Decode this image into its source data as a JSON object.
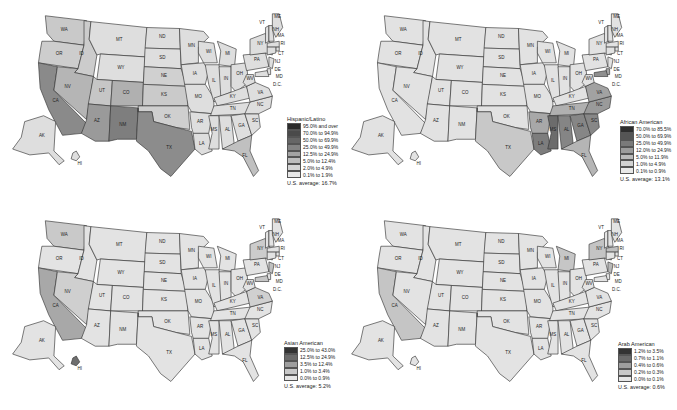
{
  "maps": [
    {
      "id": "hispanic",
      "legend": {
        "title": "Hispanic/Latino",
        "classes": [
          "95.0% and over",
          "70.0% to 94.9%",
          "50.0% to 69.9%",
          "25.0% to 49.9%",
          "12.5% to 24.9%",
          "5.0% to 12.4%",
          "2.0% to 4.9%",
          "0.1% to 1.9%"
        ],
        "colors": [
          "#2b2b2b",
          "#4a4a4a",
          "#666666",
          "#838383",
          "#a3a3a3",
          "#bdbdbd",
          "#d4d4d4",
          "#e8e8e8"
        ],
        "average": "U.S. average: 16.7%"
      }
    },
    {
      "id": "african-american",
      "legend": {
        "title": "African American",
        "classes": [
          "70.0% to 85.5%",
          "50.0% to 69.9%",
          "25.0% to 49.9%",
          "12.0% to 24.9%",
          "5.0% to 11.9%",
          "1.0% to 4.9%",
          "0.1% to 0.9%"
        ],
        "colors": [
          "#2e2e2e",
          "#555555",
          "#7a7a7a",
          "#9c9c9c",
          "#bababa",
          "#d2d2d2",
          "#e8e8e8"
        ],
        "average": "U.S. average: 13.1%"
      }
    },
    {
      "id": "asian-american",
      "legend": {
        "title": "Asian American",
        "classes": [
          "25.0% to 43.0%",
          "12.5% to 24.9%",
          "3.5% to 12.4%",
          "1.0% to 3.4%",
          "0.0% to 0.9%"
        ],
        "colors": [
          "#333333",
          "#6a6a6a",
          "#9e9e9e",
          "#c8c8c8",
          "#e6e6e6"
        ],
        "average": "U.S. average: 5.2%"
      }
    },
    {
      "id": "arab-american",
      "legend": {
        "title": "Arab American",
        "classes": [
          "1.2% to 3.5%",
          "0.7% to 1.1%",
          "0.4% to 0.6%",
          "0.2% to 0.3%",
          "0.0% to 0.1%"
        ],
        "colors": [
          "#333333",
          "#6a6a6a",
          "#9e9e9e",
          "#c8c8c8",
          "#e6e6e6"
        ],
        "average": "U.S. average: 0.6%"
      }
    }
  ],
  "state_labels": [
    "WA",
    "OR",
    "CA",
    "ID",
    "NV",
    "MT",
    "WY",
    "UT",
    "AZ",
    "CO",
    "NM",
    "ND",
    "SD",
    "NE",
    "KS",
    "OK",
    "TX",
    "MN",
    "IA",
    "MO",
    "AR",
    "LA",
    "WI",
    "IL",
    "MI",
    "IN",
    "OH",
    "KY",
    "TN",
    "MS",
    "AL",
    "GA",
    "FL",
    "SC",
    "NC",
    "VA",
    "WV",
    "PA",
    "NY",
    "VT",
    "NH",
    "ME",
    "MA",
    "RI",
    "CT",
    "NJ",
    "DE",
    "MD",
    "D.C.",
    "AK",
    "HI"
  ],
  "region_shading": {
    "hispanic": {
      "CA": "#8a8a8a",
      "AZ": "#9a9a9a",
      "NM": "#7e7e7e",
      "TX": "#8c8c8c",
      "CO": "#b0b0b0",
      "NV": "#b5b5b5",
      "FL": "#c0c0c0",
      "WA": "#c9c9c9",
      "OR": "#cdcdcd",
      "ID": "#cccccc",
      "UT": "#c6c6c6",
      "KS": "#cacaca",
      "OK": "#cfcfcf",
      "NE": "#d0d0d0",
      "default": "#dedede"
    },
    "african-american": {
      "MS": "#6c6c6c",
      "LA": "#7d7d7d",
      "AL": "#858585",
      "GA": "#868686",
      "SC": "#878787",
      "NC": "#9a9a9a",
      "VA": "#a2a2a2",
      "MD": "#8f8f8f",
      "TN": "#b0b0b0",
      "AR": "#a8a8a8",
      "FL": "#b5b5b5",
      "TX": "#c8c8c8",
      "DE": "#a6a6a6",
      "default": "#e2e2e2"
    },
    "asian-american": {
      "CA": "#a8a8a8",
      "WA": "#c9c9c9",
      "NV": "#cfcfcf",
      "NJ": "#c0c0c0",
      "NY": "#cccccc",
      "MD": "#c6c6c6",
      "VA": "#d0d0d0",
      "HI": "#6e6e6e",
      "default": "#e3e3e3"
    },
    "arab-american": {
      "MI": "#c6c6c6",
      "CA": "#c5c5c5",
      "NJ": "#b8b8b8",
      "NY": "#c4c4c4",
      "MA": "#bfbfbf",
      "default": "#e3e3e3"
    }
  }
}
